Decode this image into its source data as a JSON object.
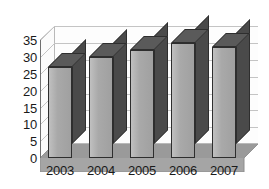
{
  "chart_data": {
    "type": "bar",
    "title": "",
    "subtitle": "",
    "xlabel": "",
    "ylabel": "",
    "categories": [
      "2003",
      "2004",
      "2005",
      "2006",
      "2007"
    ],
    "values": [
      27,
      30,
      32,
      34,
      33
    ],
    "series": [
      {
        "name": "",
        "values": [
          27,
          30,
          32,
          34,
          33
        ]
      }
    ],
    "ylim": [
      0,
      35
    ],
    "ytick_labels": [
      "0",
      "5",
      "10",
      "15",
      "20",
      "25",
      "30",
      "35"
    ],
    "ytick_values": [
      0,
      5,
      10,
      15,
      20,
      25,
      30,
      35
    ],
    "grid": true,
    "legend": false,
    "legend_position": "none",
    "style": "3d-column",
    "colors": {
      "bar_front": "#a9a9a9",
      "bar_side": "#4a4a4a",
      "bar_top": "#5a5a5a",
      "bar_outline": "#2e2e2e",
      "gridline": "#c4c4c4",
      "axis": "#6f6f6f",
      "floor": "#a0a0a0",
      "wall": "#fdfdfd",
      "text": "#1a1a1a",
      "background": "#ffffff"
    }
  }
}
